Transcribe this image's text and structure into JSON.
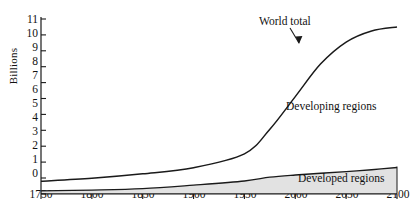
{
  "chart_data": {
    "type": "area",
    "title": "",
    "xlabel": "",
    "ylabel": "Billions",
    "xlim": [
      1750,
      2100
    ],
    "ylim": [
      0,
      11.5
    ],
    "grid": false,
    "legend_position": "inline-annotations",
    "xticks": [
      1750,
      1800,
      1850,
      1900,
      1950,
      2000,
      2050,
      2100
    ],
    "yticks": [
      0,
      1,
      2,
      3,
      4,
      5,
      6,
      7,
      8,
      9,
      10,
      11
    ],
    "x": [
      1750,
      1800,
      1850,
      1900,
      1950,
      1975,
      2000,
      2025,
      2050,
      2075,
      2100
    ],
    "series": [
      {
        "name": "World total",
        "values": [
          0.8,
          0.98,
          1.26,
          1.65,
          2.52,
          4.07,
          6.12,
          8.18,
          9.55,
          10.25,
          10.5
        ]
      },
      {
        "name": "Developed regions",
        "values": [
          0.19,
          0.24,
          0.33,
          0.55,
          0.81,
          1.05,
          1.19,
          1.3,
          1.4,
          1.52,
          1.66
        ]
      }
    ],
    "annotations": [
      {
        "text": "World total",
        "x": 2025,
        "y": 10.6,
        "arrow": true
      },
      {
        "text": "Developing regions",
        "x": 2040,
        "y": 5.1,
        "arrow": false
      },
      {
        "text": "Developed regions",
        "x": 2055,
        "y": 1.05,
        "arrow": false
      }
    ],
    "colors": {
      "line": "#1a1a1a",
      "developed_fill": "#e2e2e2",
      "developing_fill": "#ffffff",
      "axis": "#1a1a1a"
    }
  }
}
